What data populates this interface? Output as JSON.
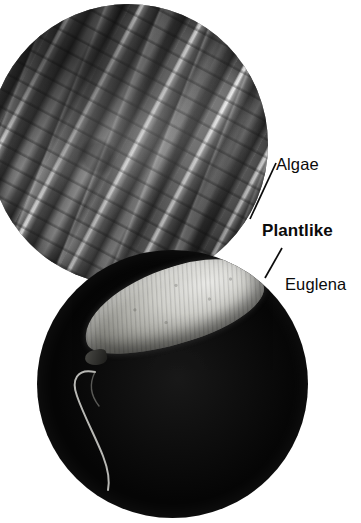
{
  "figure": {
    "category_label": "Plantlike",
    "background_color": "#ffffff",
    "text_color": "#0b0b0b"
  },
  "panels": [
    {
      "id": "algae",
      "label": "Algae",
      "shape": "circle",
      "image_kind": "light-micrograph",
      "subject": "filamentous green algae strands",
      "palette": "greyscale"
    },
    {
      "id": "euglena",
      "label": "Euglena",
      "shape": "circle",
      "image_kind": "scanning-electron-micrograph",
      "subject": "single Euglena cell with flagellum on black background",
      "palette": "greyscale"
    }
  ],
  "labels": {
    "algae": "Algae",
    "plantlike": "Plantlike",
    "euglena": "Euglena"
  },
  "leader_lines": [
    {
      "name": "algae-leader",
      "from": "plantlike-label",
      "to": "algae-circle"
    },
    {
      "name": "euglena-leader",
      "from": "plantlike-label",
      "to": "euglena-circle"
    }
  ]
}
